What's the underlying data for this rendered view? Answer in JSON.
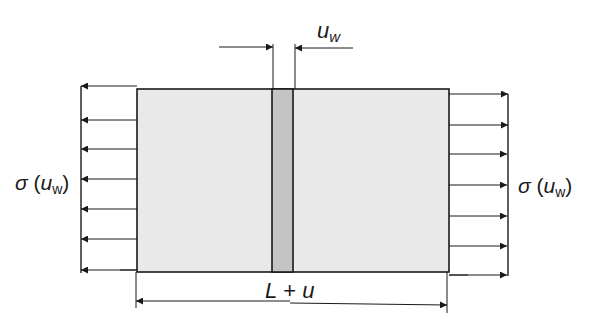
{
  "diagram": {
    "labels": {
      "crack_opening": "u",
      "crack_opening_sub": "w",
      "stress_left_sigma": "σ",
      "stress_left_open": " (",
      "stress_left_var": "u",
      "stress_left_sub": "w",
      "stress_left_close": ")",
      "stress_right_sigma": "σ",
      "stress_right_open": " (",
      "stress_right_var": "u",
      "stress_right_sub": "w",
      "stress_right_close": ")",
      "length_L": "L",
      "length_plus": " + ",
      "length_u": "u"
    },
    "colors": {
      "specimen_fill": "#e9e9e9",
      "crack_band_fill": "#c4c4c4",
      "line": "#1a1a1a"
    },
    "left_arrows_count": 7,
    "right_arrows_count": 7
  }
}
